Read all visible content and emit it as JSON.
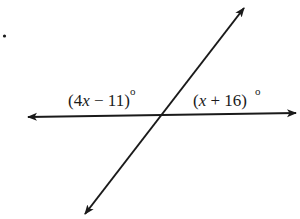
{
  "diagram": {
    "type": "intersecting-lines",
    "colors": {
      "line": "#1a1a1a",
      "background": "#ffffff"
    },
    "bullet_marker": ".",
    "lines": [
      {
        "name": "horizontal-line",
        "from": [
          26,
          117
        ],
        "to": [
          298,
          113
        ],
        "arrows": "both"
      },
      {
        "name": "transversal-line",
        "from": [
          83,
          217
        ],
        "to": [
          246,
          5
        ],
        "arrows": "both"
      }
    ],
    "intersection": [
      163,
      115
    ],
    "angles": [
      {
        "position": "left-above",
        "label_open": "(4",
        "label_var": "x",
        "label_rest": " − 11)",
        "label_full": "(4x − 11)°",
        "degree": "o"
      },
      {
        "position": "right-above",
        "label_open": "(",
        "label_var": "x",
        "label_rest": " + 16)",
        "label_full": "(x + 16)°",
        "degree": "o"
      }
    ]
  }
}
